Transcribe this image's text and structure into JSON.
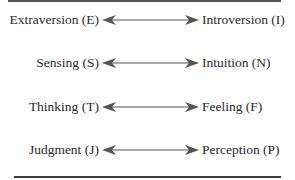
{
  "pairs": [
    {
      "left": "Extraversion (E)",
      "right": "Introversion (I)"
    },
    {
      "left": "Sensing (S)",
      "right": "Intuition (N)"
    },
    {
      "left": "Thinking (T)",
      "right": "Feeling (F)"
    },
    {
      "left": "Judgment (J)",
      "right": "Perception (P)"
    }
  ],
  "connector": "double-headed-arrow-icon",
  "colors": {
    "text": "#2a2a2a",
    "arrow": "#555555",
    "rule": "#3a3a3a"
  }
}
